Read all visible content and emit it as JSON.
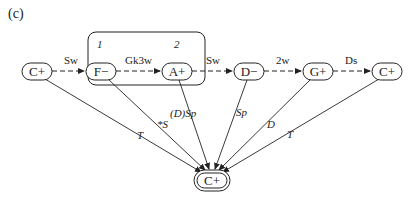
{
  "panel_label": "(c)",
  "nodes": [
    {
      "id": "n0",
      "label": "C+",
      "x": 37,
      "y": 71
    },
    {
      "id": "n1",
      "label": "F−",
      "x": 101,
      "y": 71,
      "number": "1"
    },
    {
      "id": "n2",
      "label": "A+",
      "x": 177,
      "y": 71,
      "number": "2"
    },
    {
      "id": "n3",
      "label": "D−",
      "x": 249,
      "y": 71
    },
    {
      "id": "n4",
      "label": "G+",
      "x": 318,
      "y": 71
    },
    {
      "id": "n5",
      "label": "C+",
      "x": 387,
      "y": 71
    },
    {
      "id": "target",
      "label": "C+",
      "x": 212,
      "y": 180
    }
  ],
  "sequence_edges": [
    {
      "from": "n0",
      "to": "n1",
      "label": "Sw"
    },
    {
      "from": "n1",
      "to": "n2",
      "label": "Gk3w"
    },
    {
      "from": "n2",
      "to": "n3",
      "label": "Sw"
    },
    {
      "from": "n3",
      "to": "n4",
      "label": "2w"
    },
    {
      "from": "n4",
      "to": "n5",
      "label": "Ds"
    }
  ],
  "convergent_edges": [
    {
      "from": "n0",
      "label": "T"
    },
    {
      "from": "n1",
      "label": "*S"
    },
    {
      "from": "n2",
      "label": "(D)Sp"
    },
    {
      "from": "n3",
      "label": "Sp"
    },
    {
      "from": "n4",
      "label": "D"
    },
    {
      "from": "n5",
      "label": "T"
    }
  ],
  "group_box": {
    "contains": [
      "n1",
      "n2"
    ]
  }
}
